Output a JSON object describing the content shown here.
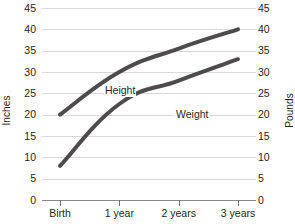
{
  "chart_data": {
    "type": "line",
    "title": "",
    "xlabel": "",
    "ylabel": "Inches",
    "y2label": "Pounds",
    "categories": [
      "Birth",
      "1 year",
      "2 years",
      "3 years"
    ],
    "ylim": [
      0,
      45
    ],
    "y2lim": [
      0,
      45
    ],
    "ytick_labels": [
      "0",
      "5",
      "10",
      "15",
      "20",
      "25",
      "30",
      "35",
      "40",
      "45"
    ],
    "ytick_values": [
      0,
      5,
      10,
      15,
      20,
      25,
      30,
      35,
      40,
      45
    ],
    "y2tick_labels": [
      "0",
      "5",
      "10",
      "15",
      "20",
      "25",
      "30",
      "35",
      "40",
      "45"
    ],
    "y2tick_values": [
      0,
      5,
      10,
      15,
      20,
      25,
      30,
      35,
      40,
      45
    ],
    "grid": "horizontal",
    "legend": "inline-annotations",
    "series": [
      {
        "name": "Height",
        "axis": "left",
        "unit": "Inches",
        "values": [
          20,
          30,
          35.5,
          40
        ],
        "color": "#4e4b4c",
        "annotation": "Height"
      },
      {
        "name": "Weight",
        "axis": "right",
        "unit": "Pounds",
        "values": [
          8,
          22.5,
          28,
          33
        ],
        "color": "#4e4b4c",
        "annotation": "Weight"
      }
    ]
  },
  "axes": {
    "left_title": "Inches",
    "right_title": "Pounds"
  },
  "annotations": {
    "height_label": "Height",
    "weight_label": "Weight"
  }
}
